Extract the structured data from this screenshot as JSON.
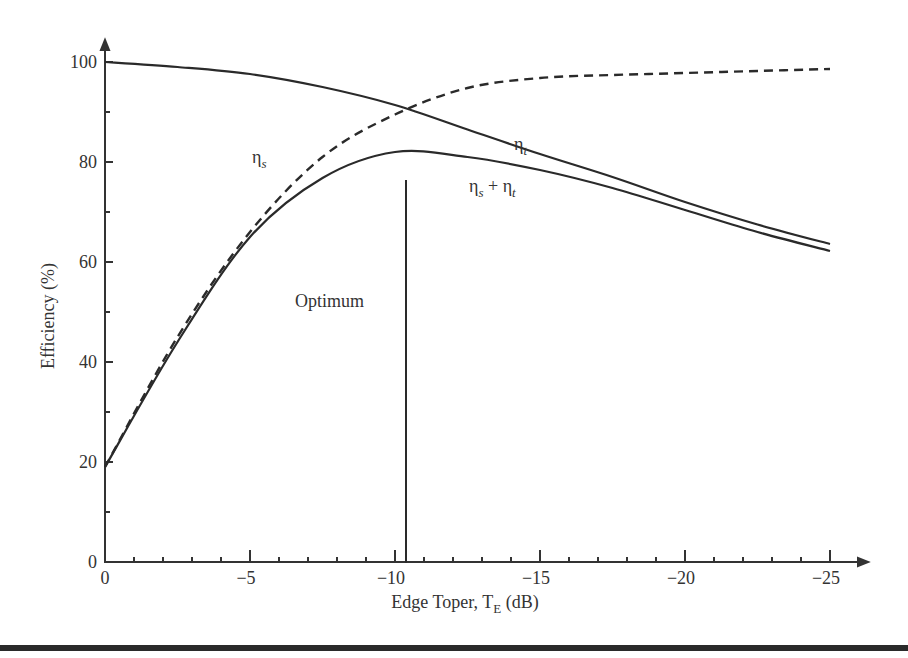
{
  "chart_data": {
    "type": "line",
    "title": "",
    "xlabel": "Edge Toper, T",
    "xlabel_subscript": "E",
    "xlabel_suffix": " (dB)",
    "ylabel": "Efficiency (%)",
    "xlim": [
      0,
      -25
    ],
    "ylim": [
      0,
      100
    ],
    "grid": false,
    "legend": "none (inline curve labels)",
    "x_ticks": [
      0,
      -5,
      -10,
      -15,
      -20,
      -25
    ],
    "x_tick_labels": [
      "0",
      "−5",
      "−10",
      "−15",
      "−20",
      "−25"
    ],
    "y_ticks": [
      0,
      20,
      40,
      60,
      80,
      100
    ],
    "y_tick_labels": [
      "0",
      "20",
      "40",
      "60",
      "80",
      "100"
    ],
    "x": [
      0,
      -2.5,
      -5,
      -7.5,
      -10,
      -12.5,
      -15,
      -17.5,
      -20,
      -22.5,
      -25
    ],
    "series": [
      {
        "name": "ηs (spillover efficiency)",
        "style": "dashed",
        "values": [
          19,
          45,
          66,
          81,
          89.5,
          94.8,
          96.8,
          97.4,
          97.8,
          98.2,
          98.6
        ]
      },
      {
        "name": "ηt (taper efficiency)",
        "style": "solid",
        "values": [
          100,
          99,
          97.6,
          95,
          91.4,
          86.5,
          81.6,
          77,
          72,
          67.5,
          63.6
        ]
      },
      {
        "name": "ηs + ηt (combined)",
        "style": "solid",
        "values": [
          19,
          44,
          65,
          76.8,
          82,
          81,
          78.4,
          74.8,
          70.4,
          66,
          62.2
        ]
      }
    ],
    "annotations": [
      {
        "text": "Optimum",
        "type": "vertical-line",
        "x": -10.5,
        "y_range": [
          1,
          77
        ]
      },
      {
        "text": "ηs",
        "near_series": "ηs",
        "x": -5.5,
        "y": 80
      },
      {
        "text": "ηt",
        "near_series": "ηt",
        "x": -14,
        "y": 83
      },
      {
        "text": "ηs + ηt",
        "near_series": "ηs + ηt",
        "x": -13,
        "y": 75
      }
    ],
    "crossing_point": {
      "x": -10.1,
      "y": 90.8
    }
  },
  "labels": {
    "eta": "η",
    "sub_s": "s",
    "sub_t": "t",
    "plus": " + ",
    "optimum": "Optimum"
  }
}
